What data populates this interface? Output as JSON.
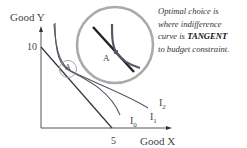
{
  "axes": {
    "y_label": "Good Y",
    "x_label": "Good X",
    "y_intercept_label": "10",
    "x_intercept_label": "5"
  },
  "curves": [
    {
      "name": "I",
      "subscript": "0"
    },
    {
      "name": "I",
      "subscript": "1"
    },
    {
      "name": "I",
      "subscript": "2"
    }
  ],
  "points": {
    "small_circle_label": "A",
    "zoom_circle_label": "A"
  },
  "annotation": {
    "line1": "Optimal choice is",
    "line2": "where indifference",
    "line3_pre": "curve is ",
    "line3_emph": "TANGENT",
    "line4": "to budget constraint."
  },
  "colors": {
    "axis": "#555555",
    "budget_line": "#333333",
    "curve": "#555566",
    "zoom_circle": "#aaaaaa"
  }
}
